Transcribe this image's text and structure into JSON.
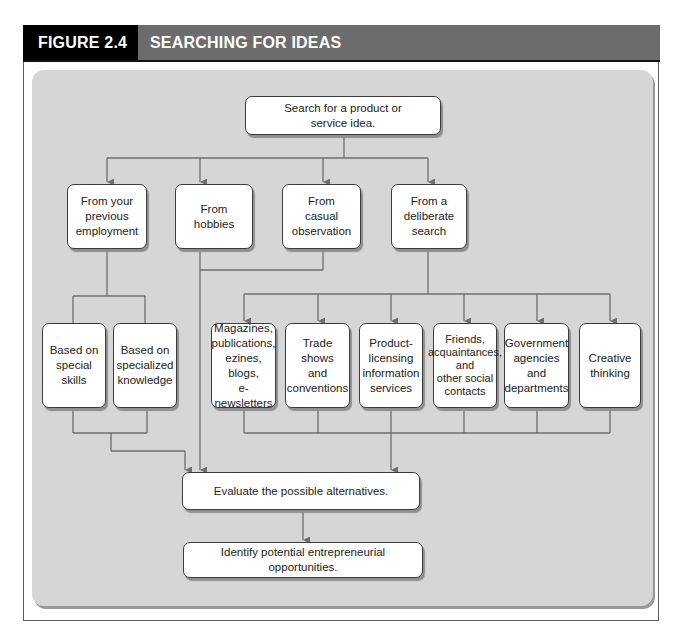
{
  "header": {
    "figure_label": "FIGURE 2.4",
    "title": "SEARCHING FOR IDEAS"
  },
  "colors": {
    "header_label_bg": "#000000",
    "header_title_bg": "#6c6c6c",
    "panel_bg": "#d6d6d6",
    "node_bg": "#ffffff",
    "connector": "#6e6e6e"
  },
  "nodes": {
    "root": "Search for a product or\nservice idea.",
    "level1": [
      "From your\nprevious\nemployment",
      "From\nhobbies",
      "From\ncasual\nobservation",
      "From a\ndeliberate\nsearch"
    ],
    "employment_children": [
      "Based on\nspecial skills",
      "Based on\nspecialized\nknowledge"
    ],
    "search_children": [
      "Magazines,\npublications,\nezines, blogs,\ne-newsletters",
      "Trade shows\nand\nconventions",
      "Product-\nlicensing\ninformation\nservices",
      "Friends,\nacquaintances,\nand\nother social\ncontacts",
      "Government\nagencies and\ndepartments",
      "Creative\nthinking"
    ],
    "evaluate": "Evaluate the possible alternatives.",
    "identify": "Identify potential entrepreneurial opportunities."
  }
}
